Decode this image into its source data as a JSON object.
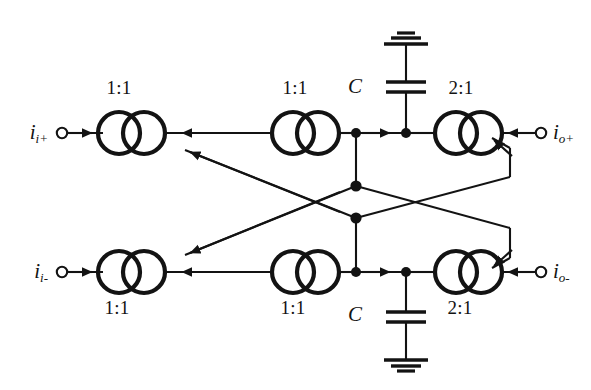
{
  "diagram": {
    "type": "circuit-schematic",
    "background_color": "#ffffff",
    "line_color": "#131313"
  },
  "terminals": {
    "input_positive": {
      "symbol": "i",
      "subscript": "i+",
      "position": "left-top"
    },
    "input_negative": {
      "symbol": "i",
      "subscript": "i-",
      "position": "left-bottom"
    },
    "output_positive": {
      "symbol": "i",
      "subscript": "o+",
      "position": "right-top"
    },
    "output_negative": {
      "symbol": "i",
      "subscript": "o-",
      "position": "right-bottom"
    }
  },
  "transformers": {
    "top_left": {
      "ratio": "1:1",
      "label_position": "above"
    },
    "top_middle": {
      "ratio": "1:1",
      "label_position": "above"
    },
    "top_right": {
      "ratio": "2:1",
      "label_position": "above"
    },
    "bottom_left": {
      "ratio": "1:1",
      "label_position": "below"
    },
    "bottom_middle": {
      "ratio": "1:1",
      "label_position": "below"
    },
    "bottom_right": {
      "ratio": "2:1",
      "label_position": "below"
    }
  },
  "capacitors": {
    "top": {
      "label": "C",
      "label_position": "left",
      "ground": "above"
    },
    "bottom": {
      "label": "C",
      "label_position": "left",
      "ground": "below"
    }
  },
  "notes": {
    "cross_coupling": "diagonal cross links between top and bottom rails",
    "junction_dots": 8
  }
}
